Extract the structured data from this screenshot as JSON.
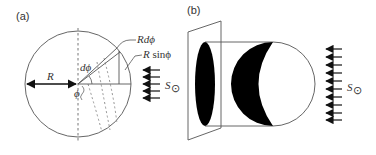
{
  "panel_a": {
    "label": "(a)",
    "radius_label": "R",
    "dphi_label": "dϕ",
    "phi_label": "ϕ",
    "arc_label": "Rdϕ",
    "sine_label_R": "R",
    "sine_label_fn": " sinϕ",
    "source_label": "S",
    "source_subscript": "⊙",
    "arrow_count": 5
  },
  "panel_b": {
    "label": "(b)",
    "source_label": "S",
    "source_subscript": "⊙",
    "arrow_count": 10
  },
  "colors": {
    "line": "#555555",
    "fill": "#000000",
    "dashed": "#777777"
  }
}
